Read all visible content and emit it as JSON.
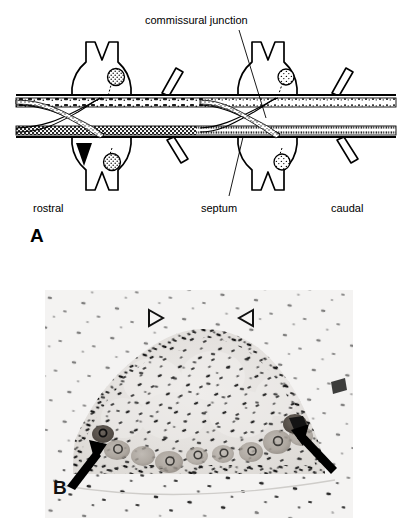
{
  "figure": {
    "panels": [
      {
        "letter": "A",
        "type": "schematic-line-drawing",
        "description": "Diagram of paired ganglia of a segmented nerve cord showing commissural junction and septum",
        "labels": {
          "commissural_junction": "commissural  junction",
          "septum": "septum",
          "rostral": "rostral",
          "caudal": "caudal"
        },
        "markers": {
          "solid_arrowhead": "solid-arrowhead-up"
        }
      },
      {
        "letter": "B",
        "type": "photomicrograph",
        "description": "Grayscale histological section of a ganglion with stained nuclei and neuron cell bodies",
        "markers": {
          "open_arrowhead_left": "open-arrowhead",
          "open_arrowhead_right": "open-arrowhead",
          "solid_arrow_left": "solid-arrow",
          "solid_arrow_right": "solid-arrow"
        }
      }
    ]
  },
  "colors": {
    "ink": "#000000",
    "photo_background": "#f2f2f2",
    "photo_tissue": "#e6e4e2",
    "photo_nuclei": "#1a1a1a"
  }
}
